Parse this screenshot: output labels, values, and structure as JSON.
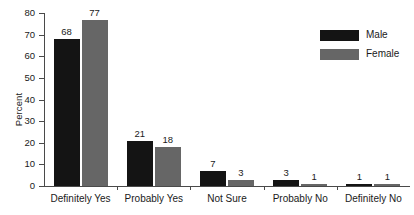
{
  "chart_data": {
    "type": "bar",
    "title": "",
    "xlabel": "",
    "ylabel": "Percent",
    "ylim": [
      0,
      80
    ],
    "yticks": [
      0,
      10,
      20,
      30,
      40,
      50,
      60,
      70,
      80
    ],
    "grid": false,
    "legend_position": "top-right",
    "categories": [
      "Definitely Yes",
      "Probably Yes",
      "Not Sure",
      "Probably No",
      "Definitely No"
    ],
    "series": [
      {
        "name": "Male",
        "color": "#141414",
        "values": [
          68,
          21,
          7,
          3,
          1
        ]
      },
      {
        "name": "Female",
        "color": "#666666",
        "values": [
          77,
          18,
          3,
          1,
          1
        ]
      }
    ]
  }
}
